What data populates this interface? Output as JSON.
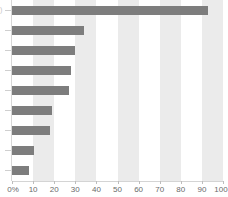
{
  "chart_data": {
    "type": "bar",
    "orientation": "horizontal",
    "title": "",
    "xlabel": "",
    "ylabel": "",
    "categories": [
      "",
      "",
      "",
      "",
      "",
      "",
      "",
      "",
      ""
    ],
    "values": [
      93,
      34,
      30,
      28,
      27,
      19,
      18,
      10.5,
      8
    ],
    "xlim": [
      0,
      100
    ],
    "xticks": [
      0,
      10,
      20,
      30,
      40,
      50,
      60,
      70,
      80,
      90,
      100
    ],
    "xticklabels": [
      "0%",
      "10",
      "20",
      "30",
      "40",
      "50",
      "60",
      "70",
      "80",
      "90",
      "100"
    ],
    "grid": false,
    "banding": true,
    "legend": null,
    "bar_color": "#7d7d7d",
    "band_color": "#ebebeb",
    "background_color": "#ffffff",
    "axis_color": "#d4d4d4",
    "tick_label_color": "#6a6a6a"
  },
  "axis": {
    "x_tick_labels": [
      "0%",
      "10",
      "20",
      "30",
      "40",
      "50",
      "60",
      "70",
      "80",
      "90",
      "100"
    ]
  },
  "ghost": {
    "top_left_fragment": ")"
  }
}
